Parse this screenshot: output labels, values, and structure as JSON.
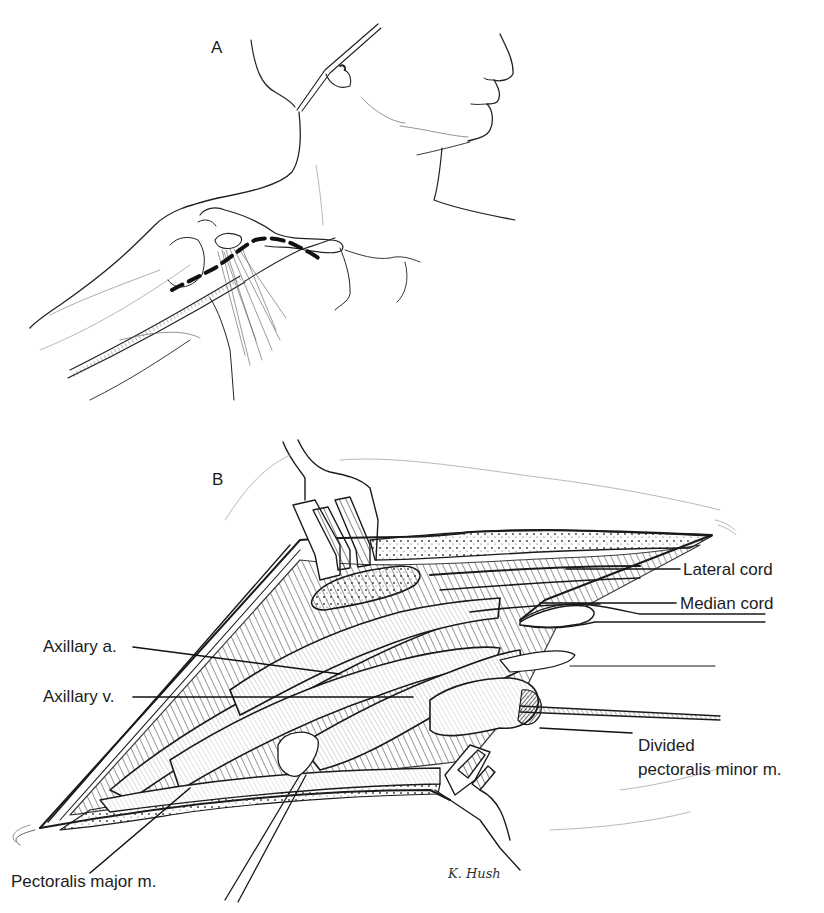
{
  "figure": {
    "panels": [
      {
        "id": "A",
        "letter": "A",
        "description": "Patient head and shoulder with dashed incision line below clavicle"
      },
      {
        "id": "B",
        "letter": "B",
        "description": "Operative exposure of axilla with retractors"
      }
    ],
    "labels": {
      "lateral_cord": "Lateral cord",
      "median_cord": "Median cord",
      "axillary_artery": "Axillary a.",
      "axillary_vein": "Axillary v.",
      "divided_pectoralis_minor_line1": "Divided",
      "divided_pectoralis_minor_line2": "pectoralis minor m.",
      "pectoralis_major": "Pectoralis major m."
    },
    "signature": "K. Hush"
  }
}
